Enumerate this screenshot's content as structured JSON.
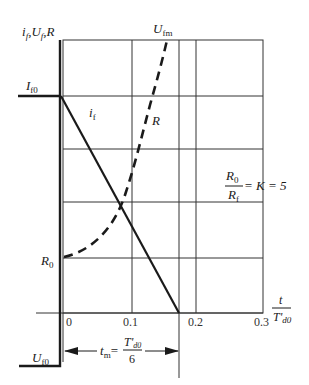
{
  "diagram": {
    "colors": {
      "line": "#1a1a1a",
      "grid": "#333333",
      "background": "#ffffff"
    },
    "axis_y_label": {
      "main": "i",
      "parts": [
        {
          "t": "i",
          "s": "f"
        },
        {
          "t": ",U",
          "s": "f"
        },
        {
          "t": ",R",
          "s": ""
        }
      ]
    },
    "axis_x_label": {
      "numerator": "t",
      "denominator": "T'",
      "denominator_sub": "d0"
    },
    "x_ticks": [
      "0",
      "0.1",
      "0.2",
      "0.3"
    ],
    "labels": {
      "if0": {
        "main": "I",
        "sub": "f0"
      },
      "uf0": {
        "main": "U",
        "sub": "f0"
      },
      "ufm": {
        "main": "U",
        "sub": "fm"
      },
      "r0": {
        "main": "R",
        "sub": "0"
      },
      "if_curve": {
        "main": "i",
        "sub": "f"
      },
      "r_curve": {
        "main": "R",
        "sub": ""
      }
    },
    "ratio": {
      "num_main": "R",
      "num_sub": "0",
      "den_main": "R",
      "den_sub": "f",
      "rhs": "= K = 5"
    },
    "tm": {
      "lhs_main": "t",
      "lhs_sub": "m",
      "eq": "=",
      "num": "T'",
      "num_sub": "d0",
      "den": "6"
    }
  }
}
